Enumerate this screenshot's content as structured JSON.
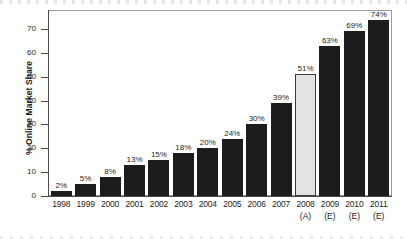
{
  "chart_data": {
    "type": "bar",
    "title": "",
    "subtitle": "",
    "xlabel": "",
    "ylabel": "% Online Market Share",
    "ylim": [
      0,
      78
    ],
    "yticks": [
      0,
      10,
      20,
      30,
      40,
      50,
      60,
      70
    ],
    "ytick_labels": [
      "0",
      "10",
      "20",
      "30",
      "40",
      "50",
      "60",
      "70"
    ],
    "grid": false,
    "legend": "none",
    "categories": [
      "1998",
      "1999",
      "2000",
      "2001",
      "2002",
      "2003",
      "2004",
      "2005",
      "2006",
      "2007",
      "2008",
      "2009",
      "2010",
      "2011"
    ],
    "category_notes": [
      "",
      "",
      "",
      "",
      "",
      "",
      "",
      "",
      "",
      "",
      "(A)",
      "(E)",
      "(E)",
      "(E)"
    ],
    "values": [
      2,
      5,
      8,
      13,
      15,
      18,
      20,
      24,
      30,
      39,
      51,
      63,
      69,
      74
    ],
    "value_labels": [
      "2%",
      "5%",
      "8%",
      "13%",
      "15%",
      "18%",
      "20%",
      "24%",
      "30%",
      "39%",
      "51%",
      "63%",
      "69%",
      "74%"
    ],
    "bar_styles": [
      "dark",
      "dark",
      "dark",
      "dark",
      "dark",
      "dark",
      "dark",
      "dark",
      "dark",
      "dark",
      "light",
      "dark",
      "dark",
      "dark"
    ],
    "colors": {
      "bar_dark": "#1c1c1c",
      "bar_light": "#e3e3e3",
      "bar_light_border": "#3a3a3a",
      "axis": "#4a4a4a",
      "frame": "#9a9a9a",
      "text": "#1d1d1d",
      "background": "#ffffff"
    },
    "notes_legend": {
      "A": "(A)",
      "E": "(E)"
    }
  }
}
